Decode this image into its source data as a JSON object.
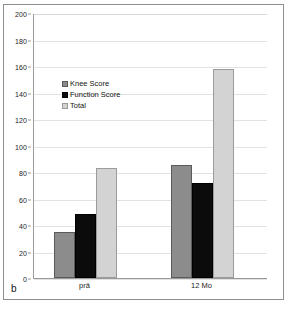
{
  "figure": {
    "panel_label": "b",
    "caption_partial": ""
  },
  "chart_data": {
    "type": "bar",
    "title": "",
    "xlabel": "",
    "ylabel": "",
    "categories": [
      "prä",
      "12 Mo"
    ],
    "series": [
      {
        "name": "Knee Score",
        "values": [
          35,
          85
        ],
        "color": "#8c8c8c"
      },
      {
        "name": "Function Score",
        "values": [
          48,
          72
        ],
        "color": "#0b0b0b"
      },
      {
        "name": "Total",
        "values": [
          83,
          158
        ],
        "color": "#d3d3d3"
      }
    ],
    "ylim": [
      0,
      200
    ],
    "ytick_step": 20,
    "yticks": [
      0,
      20,
      40,
      60,
      80,
      100,
      120,
      140,
      160,
      180,
      200
    ],
    "ytick_labels": [
      "0",
      "20",
      "40",
      "60",
      "80",
      "100",
      "120",
      "140",
      "160",
      "180",
      "200"
    ],
    "grid": true,
    "grid_axis": "y",
    "legend_position": "upper-left-inside",
    "legend_entries": [
      "Knee Score",
      "Function Score",
      "Total"
    ]
  }
}
